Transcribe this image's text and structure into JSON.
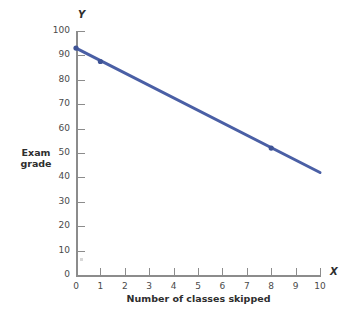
{
  "chart_data": {
    "type": "line",
    "title": "",
    "subtitle": "",
    "xlabel": "Number of classes skipped",
    "ylabel": "Exam grade",
    "x_axis_symbol": "X",
    "y_axis_symbol": "Y",
    "xlim": [
      0,
      10
    ],
    "ylim": [
      0,
      100
    ],
    "xticks": [
      0,
      1,
      2,
      3,
      4,
      5,
      6,
      7,
      8,
      9,
      10
    ],
    "yticks": [
      0,
      10,
      20,
      30,
      40,
      50,
      60,
      70,
      80,
      90,
      100
    ],
    "xtick_labels": [
      "0",
      "1",
      "2",
      "3",
      "4",
      "5",
      "6",
      "7",
      "8",
      "9",
      "10"
    ],
    "ytick_labels": [
      "0",
      "10",
      "20",
      "30",
      "40",
      "50",
      "60",
      "70",
      "80",
      "90",
      "100"
    ],
    "grid": false,
    "legend": null,
    "series": [
      {
        "name": "Exam grade",
        "color": "#4a5fa5",
        "line_width": 3,
        "x": [
          0,
          10
        ],
        "y": [
          93,
          42
        ],
        "markers": [
          {
            "x": 0,
            "y": 93
          },
          {
            "x": 1,
            "y": 87.5
          },
          {
            "x": 8,
            "y": 52
          }
        ]
      }
    ],
    "annotations": []
  },
  "colors": {
    "line": "#4a5fa5",
    "marker": "#3f5496",
    "axis": "#8c8c8c",
    "text": "#3a3a3a",
    "background": "#ffffff"
  }
}
